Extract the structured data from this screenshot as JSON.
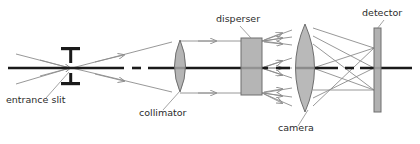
{
  "diagram": {
    "background_color": "#ffffff",
    "axis_color": "#1a1a1a",
    "ray_color": "#8c8c8c",
    "element_fill": "#a8a8a8",
    "element_stroke": "#6e6e6e",
    "label_color": "#2b2b2b",
    "labels": [
      {
        "id": "entrance-slit",
        "text": "entrance slit",
        "x": 6,
        "y": 103
      },
      {
        "id": "collimator",
        "text": "collimator",
        "x": 139,
        "y": 116
      },
      {
        "id": "disperser",
        "text": "disperser",
        "x": 216,
        "y": 22
      },
      {
        "id": "camera",
        "text": "camera",
        "x": 278,
        "y": 131
      },
      {
        "id": "detector",
        "text": "detector",
        "x": 362,
        "y": 16
      }
    ],
    "components": [
      {
        "id": "entrance-slit",
        "type": "slit",
        "x": 70,
        "axis_y": 68,
        "jaw_width": 19,
        "gap": 6,
        "bar_height": 14
      },
      {
        "id": "collimator",
        "type": "lens",
        "cx": 180,
        "cy": 66,
        "rx": 10,
        "ry": 26
      },
      {
        "id": "disperser",
        "type": "prism-block",
        "x": 241,
        "y": 38,
        "width": 21,
        "height": 57
      },
      {
        "id": "camera",
        "type": "lens",
        "cx": 305,
        "cy": 68,
        "rx": 17,
        "ry": 45
      },
      {
        "id": "detector",
        "type": "panel",
        "x": 374,
        "y": 28,
        "width": 7,
        "height": 84
      }
    ],
    "optical_axis": {
      "y": 68,
      "segments": [
        {
          "x1": 8,
          "x2": 124
        },
        {
          "x1": 132,
          "x2": 141
        },
        {
          "x1": 148,
          "x2": 268
        },
        {
          "x1": 276,
          "x2": 290
        },
        {
          "x1": 296,
          "x2": 338
        },
        {
          "x1": 345,
          "x2": 354
        },
        {
          "x1": 360,
          "x2": 412
        }
      ]
    },
    "beam_notes": {
      "input_rays": 2,
      "collimated_beams": 3,
      "dispersed_orders_per_beam": 3,
      "detector_focus_points": 3
    }
  }
}
